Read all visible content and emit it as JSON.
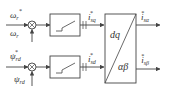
{
  "diagram": {
    "inputs": {
      "speed_ref": {
        "symbol": "ω",
        "sub": "r",
        "sup": "*"
      },
      "speed_fb": {
        "symbol": "ω",
        "sub": "r",
        "sup": ""
      },
      "flux_ref": {
        "symbol": "ψ",
        "sub": "rd",
        "sup": "*"
      },
      "flux_fb": {
        "symbol": "ψ",
        "sub": "rd",
        "sup": ""
      }
    },
    "summing_junctions": [
      {
        "id": "speed-sum",
        "minus_input": "speed_fb"
      },
      {
        "id": "flux-sum",
        "minus_input": "flux_fb"
      }
    ],
    "controllers": [
      {
        "id": "speed-controller",
        "type": "PI with limiter",
        "output": {
          "symbol": "i",
          "sub": "sq",
          "sup": "*"
        }
      },
      {
        "id": "flux-controller",
        "type": "PI with limiter",
        "output": {
          "symbol": "i",
          "sub": "sd",
          "sup": "*"
        }
      }
    ],
    "transform_block": {
      "top": "dq",
      "bottom": "αβ"
    },
    "outputs": [
      {
        "symbol": "i",
        "sub": "sα",
        "sup": "*"
      },
      {
        "symbol": "i",
        "sub": "sβ",
        "sup": "*"
      }
    ],
    "colors": {
      "line": "#444444",
      "text": "#333333",
      "background": "#ffffff"
    }
  }
}
